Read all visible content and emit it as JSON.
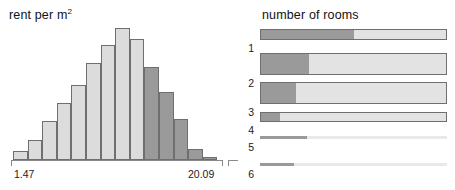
{
  "left_panel": {
    "title": "rent per m",
    "title_sup": "2",
    "axis": {
      "min_label": "1.47",
      "max_label": "20.09"
    }
  },
  "right_panel": {
    "title": "number of rooms"
  },
  "colors": {
    "light_fill": "#dcdcdc",
    "dark_fill": "#9a9a9a",
    "outline": "#6f6f6f",
    "axis": "#8a8a8a",
    "background": "#ffffff",
    "text": "#1a1a1a"
  },
  "chart_data": [
    {
      "type": "bar",
      "title": "rent per m2",
      "xlabel": "rent per m2",
      "ylabel": "",
      "grid": false,
      "legend": null,
      "xlim": [
        1.47,
        20.09
      ],
      "tick_labels": [
        "1.47",
        "20.09"
      ],
      "note": "histogram of rent per square metre; light bars are unselected, dark bars are the highlighted (selected) subset",
      "categories": [
        "1.47-2.80",
        "2.80-4.13",
        "4.13-5.46",
        "5.46-6.79",
        "6.79-8.12",
        "8.12-9.45",
        "9.45-10.78",
        "10.78-12.11",
        "12.11-13.44",
        "13.44-14.77",
        "14.77-16.10",
        "16.10-17.43",
        "17.43-18.76",
        "18.76-20.09"
      ],
      "values": [
        8,
        18,
        35,
        52,
        68,
        88,
        105,
        120,
        110,
        85,
        62,
        37,
        10,
        3
      ],
      "bar_shading": [
        "light",
        "light",
        "light",
        "light",
        "light",
        "light",
        "light",
        "light",
        "dark",
        "dark",
        "dark",
        "dark",
        "dark",
        "dark"
      ]
    },
    {
      "type": "bar",
      "orientation": "horizontal",
      "title": "number of rooms",
      "xlabel": "",
      "ylabel": "number of rooms",
      "grid": false,
      "note": "spine plot: total bar length encodes group frequency height, dark portion is the highlighted share",
      "categories": [
        "1",
        "2",
        "3",
        "4",
        "5",
        "6"
      ],
      "series": [
        {
          "name": "highlighted share (%)",
          "values": [
            50,
            26,
            19,
            10,
            25,
            18
          ]
        },
        {
          "name": "total (relative frequency %)",
          "values": [
            100,
            100,
            100,
            100,
            100,
            100
          ]
        }
      ],
      "row_thickness_relative": [
        0.3,
        1.0,
        1.0,
        0.38,
        0.05,
        0.05
      ]
    }
  ],
  "rows": [
    {
      "label": "1",
      "fill_pct": 50,
      "top": 29,
      "height": 11
    },
    {
      "label": "2",
      "fill_pct": 26,
      "top": 53,
      "height": 22
    },
    {
      "label": "3",
      "fill_pct": 19,
      "top": 82,
      "height": 22
    },
    {
      "label": "4",
      "fill_pct": 10,
      "top": 112,
      "height": 10
    },
    {
      "label": "5",
      "fill_pct": 25,
      "top": 136,
      "height": 3
    },
    {
      "label": "6",
      "fill_pct": 18,
      "top": 163,
      "height": 3
    }
  ],
  "hist_bars": [
    {
      "left": 0,
      "width": 14.6,
      "height_pct": 6.7,
      "shade": "light"
    },
    {
      "left": 14.6,
      "width": 14.6,
      "height_pct": 15.0,
      "shade": "light"
    },
    {
      "left": 29.2,
      "width": 14.6,
      "height_pct": 29.2,
      "shade": "light"
    },
    {
      "left": 43.8,
      "width": 14.6,
      "height_pct": 43.3,
      "shade": "light"
    },
    {
      "left": 58.4,
      "width": 14.6,
      "height_pct": 56.7,
      "shade": "light"
    },
    {
      "left": 73.0,
      "width": 14.6,
      "height_pct": 73.3,
      "shade": "light"
    },
    {
      "left": 87.6,
      "width": 14.6,
      "height_pct": 87.5,
      "shade": "light"
    },
    {
      "left": 102.2,
      "width": 14.6,
      "height_pct": 100.0,
      "shade": "light"
    },
    {
      "left": 116.8,
      "width": 14.6,
      "height_pct": 91.7,
      "shade": "light"
    },
    {
      "left": 131.4,
      "width": 14.6,
      "height_pct": 70.8,
      "shade": "dark"
    },
    {
      "left": 146.0,
      "width": 14.6,
      "height_pct": 51.7,
      "shade": "dark"
    },
    {
      "left": 160.6,
      "width": 14.6,
      "height_pct": 30.8,
      "shade": "dark"
    },
    {
      "left": 175.2,
      "width": 14.6,
      "height_pct": 8.3,
      "shade": "dark"
    },
    {
      "left": 189.8,
      "width": 14.6,
      "height_pct": 2.5,
      "shade": "dark"
    }
  ]
}
